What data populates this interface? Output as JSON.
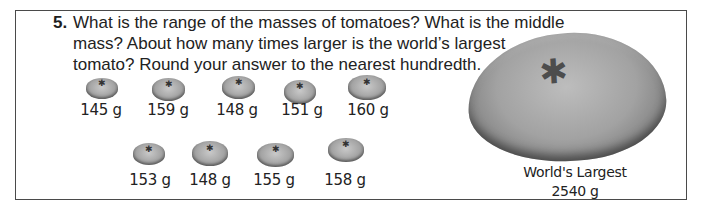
{
  "problem": {
    "number": "5.",
    "lines": [
      "What is the range of the masses of tomatoes? What is the middle",
      "mass? About how many times larger is the world’s largest",
      "tomato? Round your answer to the nearest hundredth."
    ]
  },
  "tomatoes": {
    "row1": [
      {
        "mass": "145 g",
        "icon": "tomato-icon"
      },
      {
        "mass": "159 g",
        "icon": "tomato-icon"
      },
      {
        "mass": "148 g",
        "icon": "tomato-icon"
      },
      {
        "mass": "151 g",
        "icon": "tomato-icon"
      },
      {
        "mass": "160 g",
        "icon": "tomato-icon"
      }
    ],
    "row2": [
      {
        "mass": "153 g",
        "icon": "tomato-icon"
      },
      {
        "mass": "148 g",
        "icon": "tomato-icon"
      },
      {
        "mass": "155 g",
        "icon": "tomato-icon"
      },
      {
        "mass": "158 g",
        "icon": "tomato-icon"
      }
    ]
  },
  "largest": {
    "title": "World's Largest",
    "mass": "2540 g",
    "icon": "large-tomato-icon"
  },
  "stem_glyph": "✱"
}
